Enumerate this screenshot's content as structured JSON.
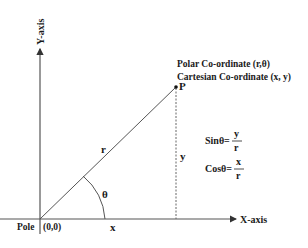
{
  "diagram": {
    "y_axis_label": "Y-axis",
    "x_axis_label": "X-axis",
    "pole_label": "Pole",
    "origin_label": "(0,0)",
    "point_label": "P",
    "polar_label": "Polar Co-ordinate (r,θ)",
    "cartesian_label": "Cartesian Co-ordinate (x, y)",
    "radius_label": "r",
    "angle_label": "θ",
    "x_label": "x",
    "y_label": "y",
    "sin": {
      "lhs": "Sinθ=",
      "num": "y",
      "den": "r"
    },
    "cos": {
      "lhs": "Cosθ=",
      "num": "x",
      "den": "r"
    },
    "colors": {
      "line": "#555555",
      "text": "#1a1a1a"
    }
  }
}
